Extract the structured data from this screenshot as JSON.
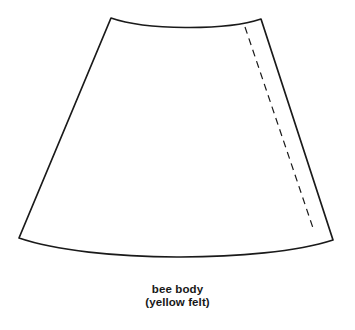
{
  "document": {
    "kind": "sewing-pattern-piece",
    "background_color": "#ffffff",
    "width": 355,
    "height": 330
  },
  "pattern_piece": {
    "name": "bee body",
    "outline_color": "#1a1a1a",
    "fill_color": "#ffffff",
    "stitch_line_color": "#1a1a1a",
    "corners": {
      "top_left": [
        111,
        18
      ],
      "top_right": [
        261,
        19
      ],
      "bottom_right": [
        333,
        240
      ],
      "bottom_left": [
        19,
        238
      ]
    },
    "top_edge": {
      "shape": "concave-curve",
      "lowest_point": [
        186,
        30
      ]
    },
    "bottom_edge": {
      "shape": "convex-curve",
      "lowest_point": [
        177,
        261
      ]
    },
    "stitch_line": {
      "style": "dashed",
      "start": [
        245,
        27
      ],
      "end": [
        313,
        228
      ]
    }
  },
  "caption": {
    "line1": "bee body",
    "line2": "(yellow felt)"
  }
}
